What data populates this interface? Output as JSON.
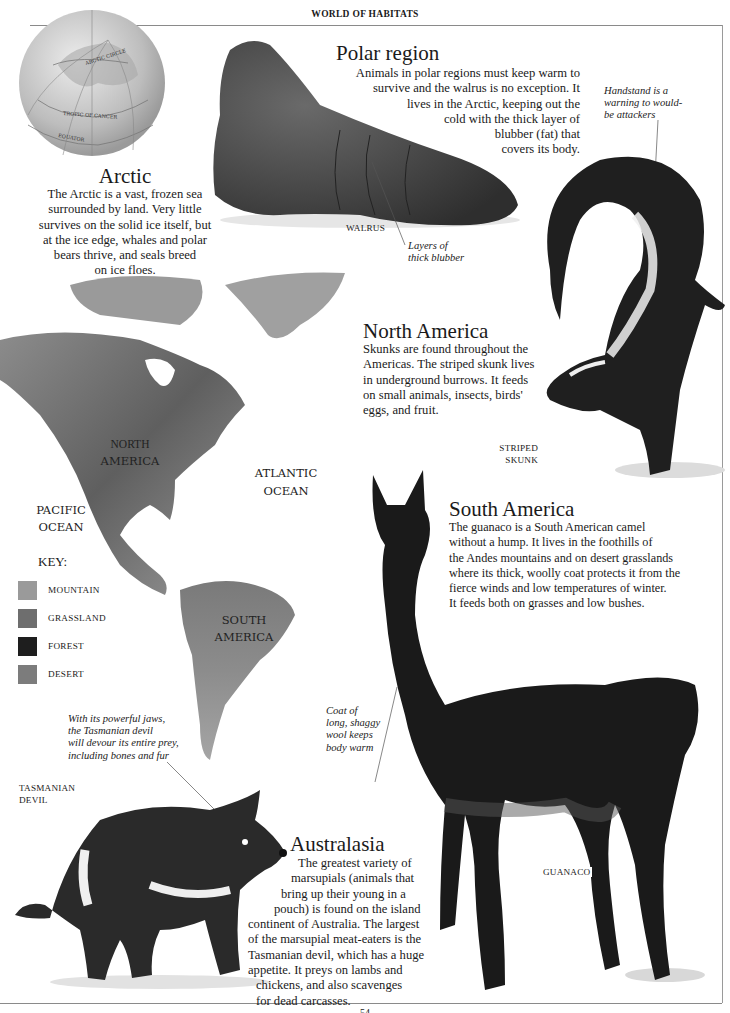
{
  "running_head": "WORLD OF HABITATS",
  "page_number": "54",
  "globe": {
    "labels": [
      "ARCTIC CIRCLE",
      "TROPIC OF CANCER",
      "EQUATOR"
    ]
  },
  "sections": {
    "arctic": {
      "title": "Arctic",
      "lines": [
        "The Arctic is a vast, frozen sea",
        "surrounded by land. Very little",
        "survives on the solid ice itself, but",
        "at the ice edge, whales and polar",
        "bears thrive, and seals breed",
        "on ice floes."
      ]
    },
    "polar": {
      "title": "Polar region",
      "lines": [
        "Animals in polar regions must keep warm to",
        "survive and the walrus is no exception. It",
        "lives in the Arctic, keeping out the",
        "cold with the thick layer of",
        "blubber (fat) that",
        "covers its body."
      ]
    },
    "north_america": {
      "title": "North America",
      "lines": [
        "Skunks are found throughout the",
        "Americas. The striped skunk lives",
        "in underground burrows. It feeds",
        "on small animals, insects, birds'",
        "eggs, and fruit."
      ]
    },
    "south_america": {
      "title": "South America",
      "lines": [
        "The guanaco is a South American camel",
        "without a hump. It lives in the foothills of",
        "the Andes mountains and on desert grasslands",
        "where its thick, woolly coat protects it from the",
        "fierce winds and low temperatures of winter.",
        "It feeds both on grasses and low bushes."
      ]
    },
    "australasia": {
      "title": "Australasia",
      "lines": [
        "The greatest variety of",
        "marsupials (animals that",
        "bring up their young in a",
        "pouch) is found on the island",
        "continent of Australia. The largest",
        "of the marsupial meat-eaters is the",
        "Tasmanian devil, which has a huge",
        "appetite. It preys on lambs and",
        "chickens, and also scavenges",
        "for dead carcasses."
      ]
    }
  },
  "captions": {
    "walrus": "WALRUS",
    "skunk_1": "STRIPED",
    "skunk_2": "SKUNK",
    "guanaco": "GUANACO",
    "devil_1": "TASMANIAN",
    "devil_2": "DEVIL"
  },
  "annotations": {
    "walrus": [
      "Layers of",
      "thick blubber"
    ],
    "skunk": [
      "Handstand is a",
      "warning to would-",
      "be attackers"
    ],
    "guanaco": [
      "Coat of",
      "long, shaggy",
      "wool keeps",
      "body warm"
    ],
    "devil": [
      "With its powerful jaws,",
      "the Tasmanian devil",
      "will devour its entire prey,",
      "including bones and fur"
    ]
  },
  "map": {
    "labels": {
      "north_america": [
        "NORTH",
        "AMERICA"
      ],
      "south_america": [
        "SOUTH",
        "AMERICA"
      ],
      "atlantic": [
        "ATLANTIC",
        "OCEAN"
      ],
      "pacific": [
        "PACIFIC",
        "OCEAN"
      ]
    },
    "key": {
      "title": "KEY:",
      "items": [
        {
          "label": "MOUNTAIN",
          "color": "#9a9a9a"
        },
        {
          "label": "GRASSLAND",
          "color": "#6e6e6e"
        },
        {
          "label": "FOREST",
          "color": "#1e1e1e"
        },
        {
          "label": "DESERT",
          "color": "#7c7c7c"
        }
      ]
    }
  }
}
